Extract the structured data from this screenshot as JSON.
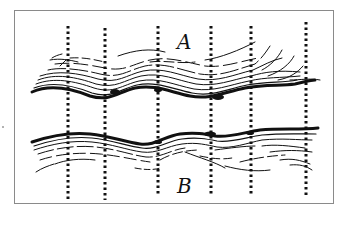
{
  "figure": {
    "labels": {
      "top_band": "A",
      "bottom_band": "B"
    },
    "colors": {
      "ink": "#111111",
      "frame": "#8a8a8a",
      "background": "#ffffff"
    },
    "dotted_lines_x": [
      68,
      105,
      158,
      211,
      251,
      306
    ]
  }
}
